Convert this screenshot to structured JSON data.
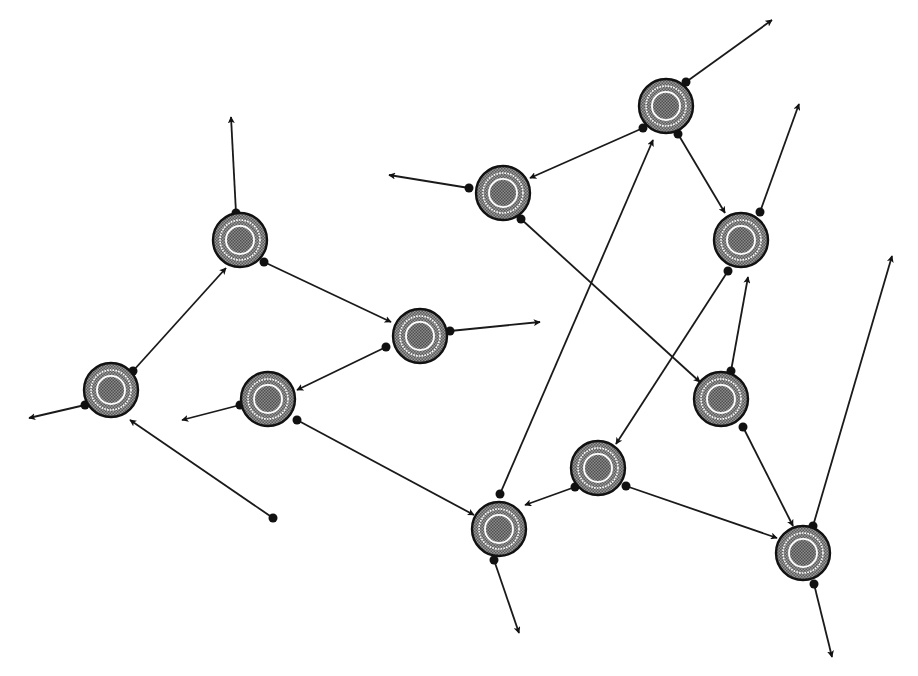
{
  "diagram": {
    "type": "directed-network",
    "node_radius": 27,
    "colors": {
      "background": "#ffffff",
      "stroke": "#111111",
      "node_fill": "#8a8a8a",
      "node_core": "#6e6e6e",
      "ring": "#ffffff"
    },
    "nodes": [
      {
        "id": "A",
        "x": 240,
        "y": 240
      },
      {
        "id": "B",
        "x": 111,
        "y": 390
      },
      {
        "id": "C",
        "x": 420,
        "y": 336
      },
      {
        "id": "D",
        "x": 268,
        "y": 399
      },
      {
        "id": "E",
        "x": 503,
        "y": 193
      },
      {
        "id": "F",
        "x": 666,
        "y": 106
      },
      {
        "id": "G",
        "x": 741,
        "y": 240
      },
      {
        "id": "H",
        "x": 721,
        "y": 399
      },
      {
        "id": "I",
        "x": 598,
        "y": 468
      },
      {
        "id": "J",
        "x": 499,
        "y": 529
      },
      {
        "id": "K",
        "x": 803,
        "y": 553
      }
    ],
    "edges": [
      {
        "from": [
          236,
          213
        ],
        "to": [
          231,
          117
        ]
      },
      {
        "from": [
          264,
          262
        ],
        "to": [
          391,
          322
        ]
      },
      {
        "from": [
          133,
          371
        ],
        "to": [
          226,
          268
        ]
      },
      {
        "from": [
          85,
          405
        ],
        "to": [
          29,
          418
        ]
      },
      {
        "from": [
          273,
          518
        ],
        "to": [
          130,
          420
        ]
      },
      {
        "from": [
          386,
          347
        ],
        "to": [
          297,
          390
        ]
      },
      {
        "from": [
          450,
          331
        ],
        "to": [
          540,
          322
        ]
      },
      {
        "from": [
          240,
          405
        ],
        "to": [
          182,
          420
        ]
      },
      {
        "from": [
          297,
          420
        ],
        "to": [
          474,
          515
        ]
      },
      {
        "from": [
          469,
          188
        ],
        "to": [
          389,
          175
        ]
      },
      {
        "from": [
          521,
          219
        ],
        "to": [
          700,
          382
        ]
      },
      {
        "from": [
          643,
          128
        ],
        "to": [
          530,
          178
        ]
      },
      {
        "from": [
          686,
          82
        ],
        "to": [
          772,
          20
        ]
      },
      {
        "from": [
          678,
          134
        ],
        "to": [
          725,
          213
        ]
      },
      {
        "from": [
          760,
          212
        ],
        "to": [
          799,
          104
        ]
      },
      {
        "from": [
          728,
          271
        ],
        "to": [
          616,
          444
        ]
      },
      {
        "from": [
          731,
          371
        ],
        "to": [
          748,
          277
        ]
      },
      {
        "from": [
          743,
          427
        ],
        "to": [
          793,
          526
        ]
      },
      {
        "from": [
          575,
          487
        ],
        "to": [
          525,
          505
        ]
      },
      {
        "from": [
          626,
          486
        ],
        "to": [
          777,
          538
        ]
      },
      {
        "from": [
          500,
          494
        ],
        "to": [
          653,
          140
        ]
      },
      {
        "from": [
          494,
          560
        ],
        "to": [
          519,
          633
        ]
      },
      {
        "from": [
          813,
          526
        ],
        "to": [
          892,
          256
        ]
      },
      {
        "from": [
          814,
          584
        ],
        "to": [
          832,
          657
        ]
      }
    ]
  }
}
